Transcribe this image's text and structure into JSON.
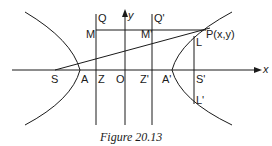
{
  "figure": {
    "caption": "Figure 20.13",
    "axes": {
      "x_label": "x",
      "y_label": "y"
    },
    "points": {
      "S": "S",
      "A": "A",
      "Z": "Z",
      "O": "O",
      "Z_prime": "Z'",
      "A_prime": "A'",
      "S_prime": "S'",
      "M": "M",
      "M_prime": "M'",
      "Q": "Q",
      "Q_prime": "Q'",
      "P": "P(x,y)",
      "L": "L",
      "L_prime": "L'"
    },
    "colors": {
      "ink": "#1a1a1a",
      "background": "#ffffff"
    }
  }
}
